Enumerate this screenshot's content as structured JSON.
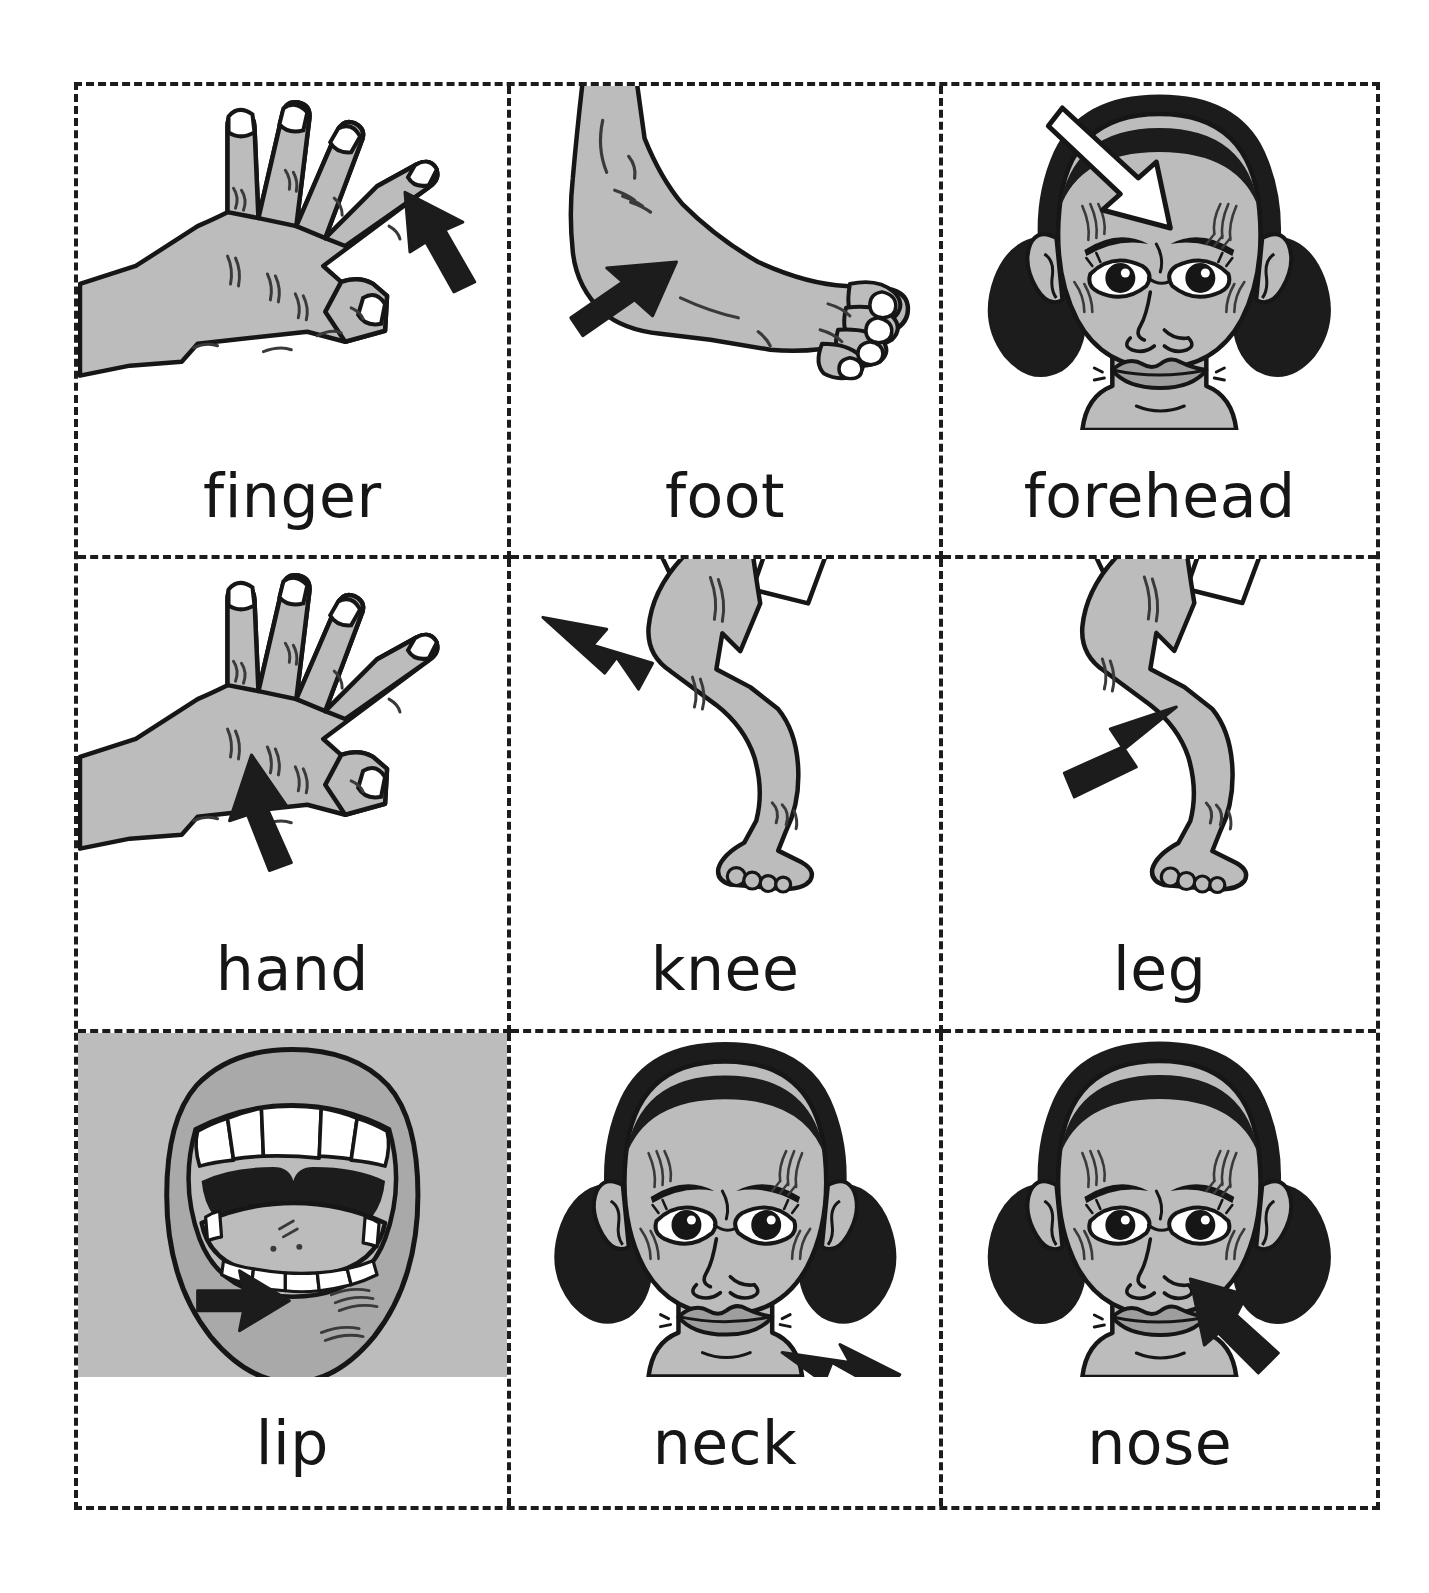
{
  "page": {
    "kind": "flashcard-sheet",
    "background": "#ffffff",
    "border_style": "dashed",
    "border_color": "#1c1c1c",
    "columns": 3,
    "rows": 3
  },
  "palette": {
    "ink": "#161616",
    "skin": "#bcbcbc",
    "skin_shadow": "#a9a9a9",
    "hair": "#1c1c1c",
    "arrow_dark": "#1c1c1c",
    "arrow_light": "#ffffff",
    "teeth": "#ffffff",
    "card_background": "#ffffff",
    "lip_plate": "#bcbcbc"
  },
  "cards": [
    {
      "id": "finger",
      "label": "finger",
      "icon": "hand-back-finger-icon",
      "subject": "hand with arrow pointing at little finger",
      "arrow": {
        "color": "dark",
        "direction": "up-left",
        "target": "little finger"
      },
      "background": "white",
      "row": 1,
      "col": 1
    },
    {
      "id": "foot",
      "label": "foot",
      "icon": "foot-side-icon",
      "subject": "side view of a bare foot with arrow pointing at the instep",
      "arrow": {
        "color": "dark",
        "direction": "up-right",
        "target": "instep"
      },
      "background": "white",
      "row": 1,
      "col": 2
    },
    {
      "id": "forehead",
      "label": "forehead",
      "icon": "girl-face-forehead-icon",
      "subject": "girl's face with white arrow pointing at forehead",
      "arrow": {
        "color": "light",
        "direction": "down-right",
        "target": "forehead"
      },
      "background": "white",
      "row": 1,
      "col": 3
    },
    {
      "id": "hand",
      "label": "hand",
      "icon": "hand-back-icon",
      "subject": "hand with arrow pointing at the back of the hand",
      "arrow": {
        "color": "dark",
        "direction": "up-left",
        "target": "back of hand"
      },
      "background": "white",
      "row": 2,
      "col": 1
    },
    {
      "id": "knee",
      "label": "knee",
      "icon": "leg-knee-icon",
      "subject": "bent leg with arrow pointing at the knee",
      "arrow": {
        "color": "dark",
        "direction": "right-down",
        "target": "knee"
      },
      "background": "white",
      "row": 2,
      "col": 2
    },
    {
      "id": "leg",
      "label": "leg",
      "icon": "leg-icon",
      "subject": "bent leg with arrow pointing at the calf",
      "arrow": {
        "color": "dark",
        "direction": "up-right",
        "target": "lower leg"
      },
      "background": "white",
      "row": 2,
      "col": 3
    },
    {
      "id": "lip",
      "label": "lip",
      "icon": "open-mouth-lip-icon",
      "subject": "open mouth showing teeth and tongue with arrow pointing at lower lip",
      "arrow": {
        "color": "dark",
        "direction": "right",
        "target": "lower lip"
      },
      "background": "gray",
      "row": 3,
      "col": 1
    },
    {
      "id": "neck",
      "label": "neck",
      "icon": "girl-face-neck-icon",
      "subject": "girl's face with arrow pointing at the neck",
      "arrow": {
        "color": "dark",
        "direction": "up-left",
        "target": "neck"
      },
      "background": "white",
      "row": 3,
      "col": 2
    },
    {
      "id": "nose",
      "label": "nose",
      "icon": "girl-face-nose-icon",
      "subject": "girl's face with arrow pointing at the nose",
      "arrow": {
        "color": "dark",
        "direction": "up-left",
        "target": "nose"
      },
      "background": "white",
      "row": 3,
      "col": 3
    }
  ]
}
